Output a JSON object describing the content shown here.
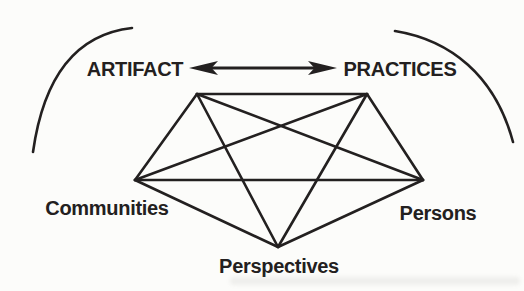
{
  "colors": {
    "ink": "#232020",
    "background": "#fcfcfa"
  },
  "labels": {
    "artifact": "ARTIFACT",
    "practices": "PRACTICES",
    "communities": "Communities",
    "persons": "Persons",
    "perspectives": "Perspectives"
  },
  "structure": {
    "type": "complete-graph-pentagon",
    "nodes": [
      "ARTIFACT",
      "PRACTICES",
      "Communities",
      "Persons",
      "Perspectives"
    ],
    "edges": [
      [
        "ARTIFACT",
        "PRACTICES"
      ],
      [
        "ARTIFACT",
        "Communities"
      ],
      [
        "ARTIFACT",
        "Persons"
      ],
      [
        "ARTIFACT",
        "Perspectives"
      ],
      [
        "PRACTICES",
        "Communities"
      ],
      [
        "PRACTICES",
        "Persons"
      ],
      [
        "PRACTICES",
        "Perspectives"
      ],
      [
        "Communities",
        "Persons"
      ],
      [
        "Communities",
        "Perspectives"
      ],
      [
        "Persons",
        "Perspectives"
      ]
    ],
    "arrow": {
      "type": "bidirectional",
      "between": [
        "ARTIFACT",
        "PRACTICES"
      ]
    }
  }
}
